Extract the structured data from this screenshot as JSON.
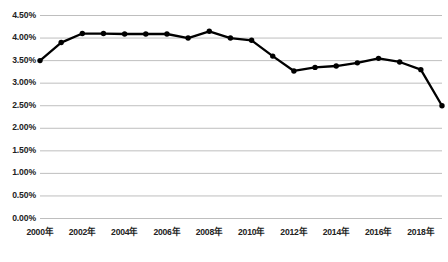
{
  "chart_data": {
    "type": "line",
    "title": "",
    "subtitle": "",
    "xlabel": "",
    "ylabel": "",
    "grid": true,
    "legend": "none",
    "ylim": [
      0,
      4.5
    ],
    "ytick_labels": [
      "4.50%",
      "4.00%",
      "3.50%",
      "3.00%",
      "2.50%",
      "2.00%",
      "1.50%",
      "1.00%",
      "0.50%",
      "0.00%"
    ],
    "ytick_values": [
      4.5,
      4.0,
      3.5,
      3.0,
      2.5,
      2.0,
      1.5,
      1.0,
      0.5,
      0.0
    ],
    "categories": [
      "2000年",
      "2001年",
      "2002年",
      "2003年",
      "2004年",
      "2005年",
      "2006年",
      "2007年",
      "2008年",
      "2009年",
      "2010年",
      "2011年",
      "2012年",
      "2013年",
      "2014年",
      "2015年",
      "2016年",
      "2017年",
      "2018年",
      "2019年"
    ],
    "xtick_labels": [
      "2000年",
      "2002年",
      "2004年",
      "2006年",
      "2008年",
      "2010年",
      "2012年",
      "2014年",
      "2016年",
      "2018年"
    ],
    "series": [
      {
        "name": "",
        "color": "#000000",
        "marker": "circle",
        "values": [
          3.5,
          3.9,
          4.1,
          4.1,
          4.09,
          4.09,
          4.09,
          4.0,
          4.15,
          4.0,
          3.95,
          3.6,
          3.27,
          3.35,
          3.38,
          3.45,
          3.55,
          3.47,
          3.3,
          2.5
        ]
      }
    ],
    "gridline_color": "#b7b7b7",
    "background_color": "#ffffff"
  }
}
